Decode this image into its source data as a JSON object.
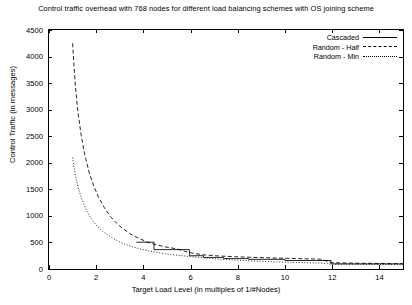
{
  "title": "Control traffic overhead with 768 nodes for different load balancing schemes with OS joining scheme",
  "axes": {
    "xlabel": "Target Load Level (in multiples of 1/#Nodes)",
    "ylabel": "Control Traffic (in messages)",
    "xticks": [
      "0",
      "2",
      "4",
      "6",
      "8",
      "10",
      "12",
      "14"
    ],
    "yticks": [
      "0",
      "500",
      "1000",
      "1500",
      "2000",
      "2500",
      "3000",
      "3500",
      "4000",
      "4500"
    ]
  },
  "legend": {
    "position": "top-right",
    "entries": [
      {
        "label": "Cascaded",
        "style": "solid"
      },
      {
        "label": "Random - Half",
        "style": "dashed"
      },
      {
        "label": "Random - Min",
        "style": "dotted"
      }
    ]
  },
  "chart_data": {
    "type": "line",
    "title": "Control traffic overhead with 768 nodes for different load balancing schemes with OS joining scheme",
    "xlabel": "Target Load Level (in multiples of 1/#Nodes)",
    "ylabel": "Control Traffic (in messages)",
    "xlim": [
      0,
      15
    ],
    "ylim": [
      0,
      4500
    ],
    "grid": false,
    "legend_position": "top-right",
    "series": [
      {
        "name": "Cascaded",
        "style": "solid",
        "x": [
          3.7,
          4.45,
          4.45,
          5.95,
          5.95,
          6.55,
          6.55,
          7.4,
          7.4,
          8.45,
          8.45,
          10.0,
          10.0,
          11.95,
          11.95,
          15.0
        ],
        "y": [
          505,
          505,
          365,
          365,
          250,
          250,
          218,
          218,
          196,
          196,
          182,
          182,
          160,
          160,
          96,
          96
        ]
      },
      {
        "name": "Random - Half",
        "style": "dashed",
        "x": [
          1.0,
          1.1,
          1.2,
          1.35,
          1.5,
          1.7,
          1.9,
          2.1,
          2.35,
          2.6,
          2.85,
          3.1,
          3.35,
          3.6,
          3.9,
          4.2,
          4.55,
          4.95,
          5.4,
          5.95,
          6.5,
          7.1,
          7.8,
          8.6,
          9.5,
          10.5,
          11.5,
          12.0,
          13.0,
          14.0,
          15.0
        ],
        "y": [
          4250,
          3550,
          3050,
          2560,
          2180,
          1820,
          1560,
          1350,
          1150,
          990,
          870,
          770,
          690,
          620,
          560,
          500,
          455,
          415,
          380,
          310,
          268,
          248,
          232,
          220,
          208,
          196,
          185,
          118,
          110,
          104,
          100
        ]
      },
      {
        "name": "Random - Min",
        "style": "dotted",
        "x": [
          1.0,
          1.1,
          1.22,
          1.36,
          1.52,
          1.7,
          1.9,
          2.12,
          2.36,
          2.62,
          2.9,
          3.2,
          3.52,
          3.86,
          4.22,
          4.6,
          5.0,
          5.45,
          5.95,
          6.5,
          7.1,
          7.8,
          8.6,
          9.5,
          10.5,
          11.5,
          12.0,
          13.0,
          14.0,
          15.0
        ],
        "y": [
          2100,
          1800,
          1560,
          1350,
          1170,
          1010,
          880,
          770,
          680,
          600,
          530,
          470,
          420,
          378,
          342,
          310,
          283,
          258,
          235,
          212,
          190,
          170,
          152,
          136,
          122,
          112,
          92,
          88,
          85,
          82
        ]
      }
    ]
  }
}
